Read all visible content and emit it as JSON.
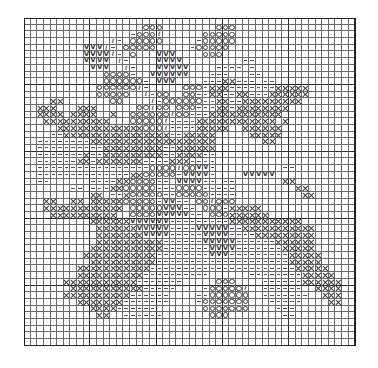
{
  "chart": {
    "title": "",
    "type": "cross-stitch pattern chart",
    "columns": 50,
    "rows": 49,
    "major_grid_every": 10,
    "legend_symbols": {
      "X": "cross-stitch",
      "V": "v-stitch",
      "o": "circle",
      "d": "dash",
      "l": "script-l"
    },
    "colors": {
      "ink": "#333333",
      "minor_grid": "#6a6a6a",
      "major_grid": "#2a2a2a",
      "background": "#ffffff"
    },
    "pattern": [
      "..................................................",
      "..................ooo........ooo..................",
      "................doool......ooooo..................",
      ".............ld.ooooo.....dooooo..................",
      ".........VVVld.ooooo.....dooooo...................",
      ".........VVVVld.o...VVV....ooo....................",
      ".........VVVV.ld....VVVV.........dd...............",
      "..........VVV..ld...VVVVV....dddd.d...............",
      "............ooood..VVVVVV...ddd...dd..............",
      "............ooooood.VVV....dddXXddd.dd............",
      "...........oooooold.....ooodXXXdddddddXXXXX.......",
      "...........ooooo..ldoo..ooddXXddXXdddXXXXXX.......",
      "....XX.......oo....ldooooooddXXddXXXXXXXXX........",
      "..XXX...XXX......ooloo.ooodddXXdXXXXXXXX..........",
      "..XXXX.XXXX..X..ooooooloodddXXXXXXXXXXX...........",
      "...XXXXXXXXXX...ooooolddddXXXXXXXXXXXX.X..........",
      ".....XXXXXXXXXXXXXooolddddXXXXX..XXXXXX...........",
      "....ddXXXXXXXXXXXXXXXXddXXXXX.....XXXXX...........",
      "..ddddddddXXXXXXXXXXXXXXXXXXX.......XX............",
      "..ddddddddddXXXXXXXXXddXXXXXX.....................",
      "..dddddddXddXXXXXXXXXddXXXXdd.....................",
      "..ddddddXXdXXXXXXXddddXXXdddd.....................",
      "..dddddddddddddddddoooolooVVd..........dd.........",
      "..ddddddddddddddXXooooodVVVVd....VVVVV...........",
      "..dd......ddddXXoooodd.VVVVdd.dd.......XX.........",
      ".......dd.dddXXooooodddooooddddd.........XX.......",
      "..........XX.ddXoooooddooooodddd..........XX......",
      "...XX..XX.XXXXXooooodVVdd.oolooo..................",
      "...XXXXXXXXXXXX.oooooVVVdd.ooodXXXXX..............",
      "....XXXXXXXXXX..ooooVVVVVdd.oooXXXXXX.............",
      "..........XXXXXXVVVVVVdddddddddXXXXXXXXXXX........",
      "...........XXXXXXVVVVVddddVVVVVddXXXXXXXXXXX......",
      "...........XXXXXXXVVVVdddddVVVVddddXXXXXXXXX......",
      "...........XXXXXXXXXXddddddVVVVVddddddXXXXXX......",
      "..........XXXXXXXXXXXdddddddVVVVdddddddXXXXX......",
      ".........XXXXXXXXXXXddddddddVVVdddddddddXXXXX.....",
      "..........XXXXXXXXXXddddddddddddddddddddXXXXX.....",
      "........XXXXXXXXXXXddddddddddddddddddddddXXXXX....",
      "........XXXXXXXXXXdddddddddd......ddddddddXXXXX...",
      "......XXXXXXXXXXXddddddd.....ooo....ddddddXXXXXX..",
      ".......XXXXXXXXXXXddddd....doooool..dddddd..XXXX..",
      "......XXXXXXXXXXdddddd....ddoooooo..ddddddd..XXX..",
      "........XXXXXXXddddddd....dooooooo...ddddd....XX..",
      "..........XXXXdddddd.......ooooooo....ddd.........",
      "...........XX..dddddd.......ooo........dd.........",
      "..................................................",
      "..................................................",
      "..................................................",
      ".................................................."
    ]
  }
}
